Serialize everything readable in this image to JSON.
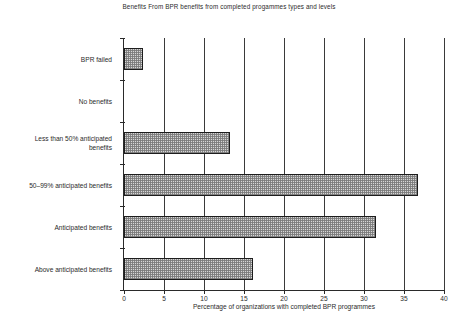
{
  "chart_data": {
    "type": "bar",
    "orientation": "horizontal",
    "title": "Benefits From BPR benefits from completed progammes types and levels",
    "xlabel": "Percentage of organizations with completed BPR programmes",
    "ylabel": "",
    "xlim": [
      0,
      40
    ],
    "xticks": [
      0,
      5,
      10,
      15,
      20,
      25,
      30,
      35,
      40
    ],
    "xticklabels": [
      "0",
      "5",
      "10",
      "15",
      "20",
      "25",
      "30",
      "35",
      "40"
    ],
    "grid": "vertical",
    "legend": "none",
    "categories": [
      "BPR failed",
      "No benefits",
      "Less than 50% anticipated\nbenefits",
      "50–99% anticipated benefits",
      "Anticipated benefits",
      "Above anticipated benefits"
    ],
    "values": [
      2.4,
      0,
      13.3,
      36.8,
      31.5,
      16.1
    ],
    "bar_fill": "#d6d6d6",
    "bar_edge": "#1d1d1d",
    "axis_color": "#2a2a2a",
    "background": "#ffffff"
  }
}
